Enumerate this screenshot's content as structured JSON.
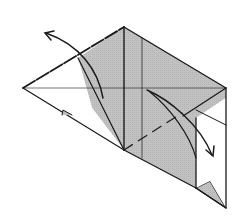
{
  "diagram": {
    "type": "origami-fold-step",
    "colors": {
      "paper_front": "#ffffff",
      "paper_back": "#bdbdbd",
      "line": "#1a1a1a"
    },
    "arrows": [
      {
        "id": "arrow-upper-left",
        "direction": "up-left"
      },
      {
        "id": "arrow-lower-right",
        "direction": "down-right"
      }
    ]
  }
}
